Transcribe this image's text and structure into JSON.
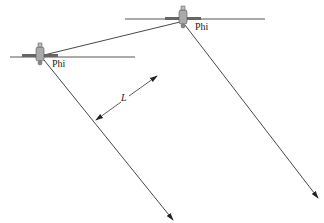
{
  "diagram": {
    "type": "satellite beam geometry",
    "satellites": [
      {
        "id": "left",
        "label": "Phi",
        "position": [
          40,
          57
        ]
      },
      {
        "id": "right",
        "label": "Phi",
        "position": [
          183,
          20
        ]
      }
    ],
    "dimension": {
      "label": "L"
    },
    "colors": {
      "line": "#333333",
      "satellite_body": "#999999",
      "background": "#ffffff"
    }
  }
}
